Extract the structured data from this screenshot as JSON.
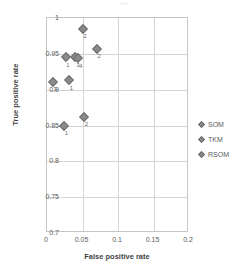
{
  "chart_data": {
    "type": "scatter",
    "title": "",
    "xlabel": "False positive rate",
    "ylabel": "True positive rate",
    "xlim": [
      0,
      0.2
    ],
    "ylim": [
      0.7,
      1
    ],
    "xticks": [
      "0",
      "0.05",
      "0.1",
      "0.15",
      "0.2"
    ],
    "xtick_values": [
      0,
      0.05,
      0.1,
      0.15,
      0.2
    ],
    "yticks": [
      "0.7",
      "0.75",
      "0.8",
      "0.85",
      "0.9",
      "0.95",
      "1"
    ],
    "ytick_values": [
      0.7,
      0.75,
      0.8,
      0.85,
      0.9,
      0.95,
      1
    ],
    "grid": true,
    "legend_position": "right",
    "legend": [
      "SOM",
      "TKM",
      "RSOM"
    ],
    "marker": "diamond",
    "marker_color": "#8a8a8a",
    "points": [
      {
        "x": 0.05,
        "y": 0.985,
        "label": "2"
      },
      {
        "x": 0.07,
        "y": 0.957,
        "label": "2"
      },
      {
        "x": 0.026,
        "y": 0.945,
        "label": "1"
      },
      {
        "x": 0.04,
        "y": 0.945,
        "label": "3"
      },
      {
        "x": 0.044,
        "y": 0.944,
        "label": "4"
      },
      {
        "x": 0.008,
        "y": 0.911,
        "label": "3"
      },
      {
        "x": 0.031,
        "y": 0.913,
        "label": "1"
      },
      {
        "x": 0.052,
        "y": 0.862,
        "label": "2"
      },
      {
        "x": 0.024,
        "y": 0.85,
        "label": "1"
      }
    ]
  },
  "legend": {
    "items": [
      {
        "name": "SOM"
      },
      {
        "name": "TKM"
      },
      {
        "name": "RSOM"
      }
    ]
  }
}
